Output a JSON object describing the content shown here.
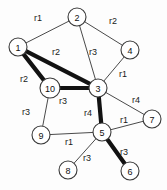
{
  "figure": {
    "kind": "undirected-weighted-graph-diagram",
    "width": 167,
    "height": 190,
    "background_color": "#fdfdfd",
    "node_fill_color": "#ffffff",
    "node_stroke_color": "#3a3a3a",
    "thin_edge_color": "#4a4a4a",
    "bold_edge_color": "#121212"
  },
  "nodes": [
    {
      "id": "1",
      "label": "1",
      "x": 18,
      "y": 47,
      "r": 9
    },
    {
      "id": "2",
      "label": "2",
      "x": 77,
      "y": 17,
      "r": 9
    },
    {
      "id": "3",
      "label": "3",
      "x": 98,
      "y": 88,
      "r": 9
    },
    {
      "id": "4",
      "label": "4",
      "x": 130,
      "y": 50,
      "r": 9
    },
    {
      "id": "5",
      "label": "5",
      "x": 102,
      "y": 132,
      "r": 9
    },
    {
      "id": "6",
      "label": "6",
      "x": 130,
      "y": 171,
      "r": 9
    },
    {
      "id": "7",
      "label": "7",
      "x": 152,
      "y": 119,
      "r": 9
    },
    {
      "id": "8",
      "label": "8",
      "x": 68,
      "y": 170,
      "r": 9
    },
    {
      "id": "9",
      "label": "9",
      "x": 41,
      "y": 135,
      "r": 9
    },
    {
      "id": "10",
      "label": "10",
      "x": 50,
      "y": 88,
      "r": 10
    }
  ],
  "edges": [
    {
      "from": "1",
      "to": "2",
      "label": "r1",
      "lx": 38,
      "ly": 18,
      "style": "thin"
    },
    {
      "from": "2",
      "to": "4",
      "label": "r2",
      "lx": 113,
      "ly": 21,
      "style": "thin"
    },
    {
      "from": "2",
      "to": "3",
      "label": "r3",
      "lx": 93,
      "ly": 52,
      "style": "thin"
    },
    {
      "from": "4",
      "to": "3",
      "label": "r1",
      "lx": 123,
      "ly": 74,
      "style": "thin"
    },
    {
      "from": "1",
      "to": "3",
      "label": "r2",
      "lx": 56,
      "ly": 52,
      "style": "bold"
    },
    {
      "from": "1",
      "to": "10",
      "label": "r2",
      "lx": 24,
      "ly": 79,
      "style": "bold"
    },
    {
      "from": "10",
      "to": "3",
      "label": "r3",
      "lx": 63,
      "ly": 101,
      "style": "bold"
    },
    {
      "from": "10",
      "to": "9",
      "label": "r3",
      "lx": 26,
      "ly": 112,
      "style": "thin"
    },
    {
      "from": "3",
      "to": "5",
      "label": "r4",
      "lx": 88,
      "ly": 113,
      "style": "bold"
    },
    {
      "from": "3",
      "to": "7",
      "label": "r4",
      "lx": 136,
      "ly": 100,
      "style": "thin"
    },
    {
      "from": "5",
      "to": "7",
      "label": "r1",
      "lx": 124,
      "ly": 120,
      "style": "thin"
    },
    {
      "from": "9",
      "to": "5",
      "label": "r1",
      "lx": 69,
      "ly": 142,
      "style": "thin"
    },
    {
      "from": "5",
      "to": "8",
      "label": "r3",
      "lx": 87,
      "ly": 158,
      "style": "thin"
    },
    {
      "from": "5",
      "to": "6",
      "label": "r3",
      "lx": 124,
      "ly": 152,
      "style": "bold"
    }
  ]
}
